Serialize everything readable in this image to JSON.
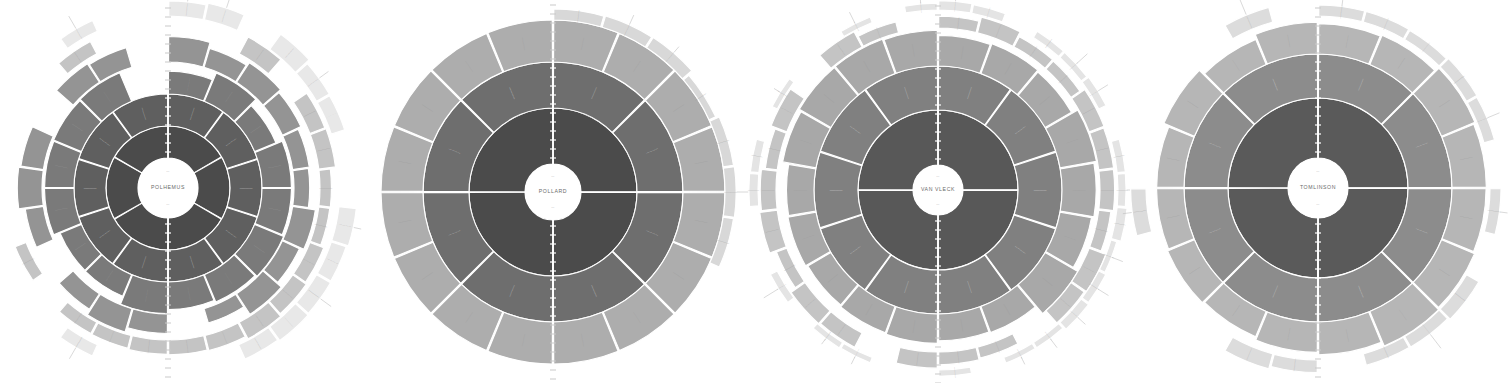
{
  "figure": {
    "type": "genealogy-fan-chart-panel",
    "panel_count": 4,
    "background_color": "#ffffff",
    "orientation": "horizontal-row"
  },
  "palette": {
    "background": "#ffffff",
    "ring_1": "#4b4b4b",
    "ring_2": "#5f5f5f",
    "ring_3": "#7a7a7a",
    "ring_4": "#949494",
    "ring_5": "#aeaeae",
    "ring_6": "#c4c4c4",
    "ring_7": "#d8d8d8",
    "ring_8": "#e8e8e8",
    "ring_9": "#f3f3f3",
    "separator": "#ffffff",
    "hub_fill": "#ffffff",
    "hub_text": "#6a6a6a",
    "fringe_stroke": "#b9b9b9",
    "tick_light": "#ffffff",
    "tick_dark": "#c9c9c9"
  },
  "charts": [
    {
      "id": "chart-polhemus",
      "center_label": "POLHEMUS",
      "cx": 168,
      "cy": 188,
      "hub_radius": 30,
      "ring_count": 6,
      "ring_outer_radii": [
        62,
        94,
        126,
        152,
        172,
        192
      ],
      "outline_regular": false,
      "note": "Irregular stepped outer boundary; several branches terminate early leaving notches.",
      "rings": [
        {
          "index": 1,
          "color": "#4b4b4b",
          "divisions": 6,
          "start_angle": -90,
          "sweep": 360
        },
        {
          "index": 2,
          "color": "#5f5f5f",
          "divisions": 10,
          "start_angle": -90,
          "sweep": 360
        },
        {
          "index": 3,
          "color": "#7a7a7a",
          "divisions": 16,
          "start_angle": -90,
          "sweep": 330
        },
        {
          "index": 4,
          "color": "#949494",
          "divisions": 22,
          "start_angle": -90,
          "sweep": 300
        },
        {
          "index": 5,
          "color": "#c4c4c4",
          "divisions": 26,
          "start_angle": -90,
          "sweep": 210
        },
        {
          "index": 6,
          "color": "#e8e8e8",
          "divisions": 30,
          "start_angle": -90,
          "sweep": 150
        }
      ]
    },
    {
      "id": "chart-pollard",
      "center_label": "POLLARD",
      "cx": 553,
      "cy": 192,
      "hub_radius": 28,
      "ring_count": 4,
      "ring_outer_radii": [
        84,
        130,
        172,
        185
      ],
      "outline_regular": true,
      "note": "Nearly complete circular outline; fullest ring coverage of the four panels.",
      "rings": [
        {
          "index": 1,
          "color": "#4b4b4b",
          "divisions": 4,
          "start_angle": -90,
          "sweep": 360
        },
        {
          "index": 2,
          "color": "#6e6e6e",
          "divisions": 8,
          "start_angle": -90,
          "sweep": 360
        },
        {
          "index": 3,
          "color": "#adadad",
          "divisions": 16,
          "start_angle": -90,
          "sweep": 360
        },
        {
          "index": 4,
          "color": "#d8d8d8",
          "divisions": 22,
          "start_angle": -90,
          "sweep": 120
        }
      ]
    },
    {
      "id": "chart-van-vleck",
      "center_label": "VAN VLECK",
      "cx": 938,
      "cy": 190,
      "hub_radius": 25,
      "ring_count": 5,
      "ring_outer_radii": [
        80,
        124,
        162,
        180,
        190
      ],
      "outline_regular": false,
      "note": "Dense outer fringe of hairline tick marks; many sixth-generation stubs.",
      "rings": [
        {
          "index": 1,
          "color": "#585858",
          "divisions": 4,
          "start_angle": -90,
          "sweep": 360
        },
        {
          "index": 2,
          "color": "#808080",
          "divisions": 10,
          "start_angle": -90,
          "sweep": 360
        },
        {
          "index": 3,
          "color": "#a8a8a8",
          "divisions": 18,
          "start_angle": -90,
          "sweep": 360
        },
        {
          "index": 4,
          "color": "#c4c4c4",
          "divisions": 26,
          "start_angle": -90,
          "sweep": 300
        },
        {
          "index": 5,
          "color": "#e4e4e4",
          "divisions": 34,
          "start_angle": -90,
          "sweep": 230
        }
      ]
    },
    {
      "id": "chart-tomlinson",
      "center_label": "TOMLINSON",
      "cx": 1318,
      "cy": 188,
      "hub_radius": 30,
      "ring_count": 4,
      "ring_outer_radii": [
        90,
        134,
        172,
        188
      ],
      "outline_regular": false,
      "note": "Broad light outer ring with scattered seventh-generation tick fringe on the maternal side.",
      "rings": [
        {
          "index": 1,
          "color": "#5a5a5a",
          "divisions": 4,
          "start_angle": -90,
          "sweep": 360
        },
        {
          "index": 2,
          "color": "#8c8c8c",
          "divisions": 8,
          "start_angle": -90,
          "sweep": 360
        },
        {
          "index": 3,
          "color": "#b6b6b6",
          "divisions": 16,
          "start_angle": -90,
          "sweep": 360
        },
        {
          "index": 4,
          "color": "#dcdcdc",
          "divisions": 24,
          "start_angle": -90,
          "sweep": 200
        }
      ]
    }
  ]
}
